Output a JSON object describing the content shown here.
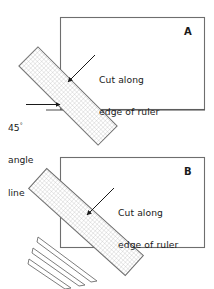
{
  "figure": {
    "type": "instructional-diagram",
    "background_color": "#ffffff",
    "line_color": "#5a5a5a",
    "text_color": "#1a1a1a",
    "hatch_color": "#b9b9b9"
  },
  "panels": [
    {
      "id": "A",
      "letter": "A",
      "callout": {
        "line1": "Cut along",
        "line2": "edge of ruler"
      },
      "angle_label": {
        "value": "45",
        "degree_symbol": "°",
        "line1": "angle",
        "line2": "line"
      },
      "rectangle": {
        "x": 60,
        "y": 17,
        "width": 145,
        "height": 93
      },
      "ruler": {
        "angle_deg": 45,
        "length": 110,
        "width": 27,
        "cx": 68,
        "cy": 96
      },
      "angle_line": {
        "x1": 46,
        "y1": 110,
        "x2": 205,
        "y2": 110
      },
      "arrow": {
        "from_x": 93,
        "from_y": 57,
        "to_x": 67,
        "to_y": 83
      },
      "angle_arrow": {
        "from_x": 26,
        "from_y": 105,
        "to_x": 59,
        "to_y": 105
      }
    },
    {
      "id": "B",
      "letter": "B",
      "callout": {
        "line1": "Cut along",
        "line2": "edge of ruler"
      },
      "rectangle": {
        "x": 60,
        "y": 157,
        "width": 145,
        "height": 91
      },
      "ruler": {
        "angle_deg": 45,
        "length": 128,
        "width": 27,
        "cx": 86,
        "cy": 222
      },
      "arrow": {
        "from_x": 112,
        "from_y": 190,
        "to_x": 86,
        "to_y": 216
      },
      "cut_strips": [
        {
          "x1": 38,
          "y1": 238,
          "x2": 97,
          "y2": 282,
          "thickness": 5
        },
        {
          "x1": 33,
          "y1": 248,
          "x2": 84,
          "y2": 285,
          "thickness": 5
        },
        {
          "x1": 29,
          "y1": 258,
          "x2": 70,
          "y2": 288,
          "thickness": 5
        }
      ]
    }
  ]
}
